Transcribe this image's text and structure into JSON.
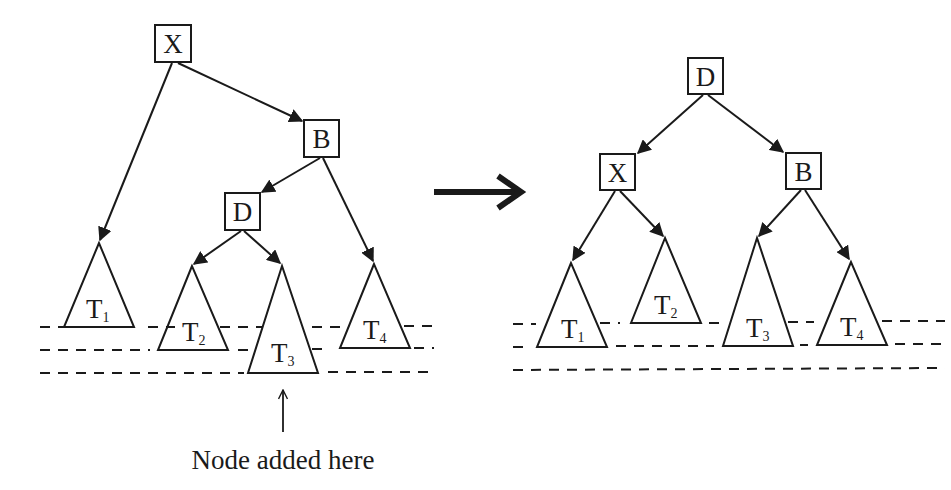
{
  "diagram": {
    "colors": {
      "stroke": "#1a1a1a",
      "background": "#ffffff"
    },
    "before": {
      "nodes": [
        {
          "id": "X",
          "label": "X",
          "x": 155,
          "y": 25,
          "w": 36,
          "h": 37
        },
        {
          "id": "B",
          "label": "B",
          "x": 304,
          "y": 120,
          "w": 35,
          "h": 37
        },
        {
          "id": "D",
          "label": "D",
          "x": 225,
          "y": 193,
          "w": 35,
          "h": 37
        }
      ],
      "subtrees": [
        {
          "id": "T1",
          "label": "T",
          "sub": "1",
          "apex": [
            99,
            243
          ],
          "base_y": 327,
          "half_w": 35
        },
        {
          "id": "T2",
          "label": "T",
          "sub": "2",
          "apex": [
            192,
            266
          ],
          "base_y": 350,
          "half_w": 35
        },
        {
          "id": "T3",
          "label": "T",
          "sub": "3",
          "apex": [
            282,
            266
          ],
          "base_y": 373,
          "half_w": 35
        },
        {
          "id": "T4",
          "label": "T",
          "sub": "4",
          "apex": [
            374,
            264
          ],
          "base_y": 348,
          "half_w": 35
        }
      ],
      "edges": [
        {
          "from": "X",
          "to": "T1"
        },
        {
          "from": "X",
          "to": "B"
        },
        {
          "from": "B",
          "to": "D"
        },
        {
          "from": "B",
          "to": "T4"
        },
        {
          "from": "D",
          "to": "T2"
        },
        {
          "from": "D",
          "to": "T3"
        }
      ],
      "level_lines_y": [
        327,
        350,
        373
      ],
      "annotation": {
        "text": "Node added here",
        "arrow_target": "T3"
      }
    },
    "transition_arrow": "→",
    "after": {
      "nodes": [
        {
          "id": "D",
          "label": "D",
          "x": 688,
          "y": 58,
          "w": 35,
          "h": 36
        },
        {
          "id": "X",
          "label": "X",
          "x": 600,
          "y": 154,
          "w": 35,
          "h": 36
        },
        {
          "id": "B",
          "label": "B",
          "x": 786,
          "y": 153,
          "w": 35,
          "h": 36
        }
      ],
      "subtrees": [
        {
          "id": "T1",
          "label": "T",
          "sub": "1",
          "apex": [
            571,
            263
          ],
          "base_y": 347,
          "half_w": 35
        },
        {
          "id": "T2",
          "label": "T",
          "sub": "2",
          "apex": [
            665,
            238
          ],
          "base_y": 323,
          "half_w": 35
        },
        {
          "id": "T3",
          "label": "T",
          "sub": "3",
          "apex": [
            757,
            238
          ],
          "base_y": 346,
          "half_w": 35
        },
        {
          "id": "T4",
          "label": "T",
          "sub": "4",
          "apex": [
            851,
            262
          ],
          "base_y": 345,
          "half_w": 35
        }
      ],
      "edges": [
        {
          "from": "D",
          "to": "X"
        },
        {
          "from": "D",
          "to": "B"
        },
        {
          "from": "X",
          "to": "T1"
        },
        {
          "from": "X",
          "to": "T2"
        },
        {
          "from": "B",
          "to": "T3"
        },
        {
          "from": "B",
          "to": "T4"
        }
      ],
      "level_lines_y": [
        323,
        346,
        370
      ]
    }
  }
}
